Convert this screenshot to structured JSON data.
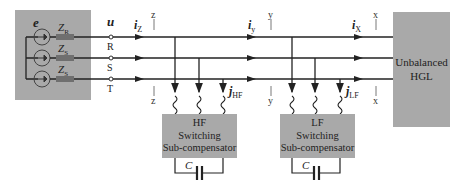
{
  "diagram": {
    "source": {
      "voltage_label": "e",
      "impedances": [
        "Z",
        "Z",
        "Z"
      ],
      "impedance_subscripts": [
        "R",
        "S",
        "S"
      ]
    },
    "terminals": {
      "voltage_label": "u",
      "phases": [
        "R",
        "S",
        "T"
      ]
    },
    "sections": [
      {
        "tick": "z",
        "current": "i",
        "current_sub": "Z"
      },
      {
        "tick": "y",
        "current": "i",
        "current_sub": "y"
      },
      {
        "tick": "x",
        "current": "i",
        "current_sub": "X"
      }
    ],
    "compensators": [
      {
        "lines": [
          "HF",
          "Switching",
          "Sub-compensator"
        ],
        "current": "j",
        "current_sub": "HF",
        "capacitor": "C"
      },
      {
        "lines": [
          "LF",
          "Switching",
          "Sub-compensator"
        ],
        "current": "j",
        "current_sub": "LF",
        "capacitor": "C"
      }
    ],
    "load": {
      "lines": [
        "Unbalanced",
        "HGL"
      ]
    },
    "colors": {
      "box_fill": "#a9a9a9",
      "line": "#222222",
      "resistor": "#6f6f6f"
    }
  }
}
